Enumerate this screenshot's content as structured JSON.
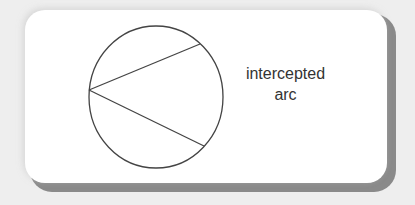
{
  "diagram": {
    "type": "inscribed-angle",
    "label_line1": "intercepted",
    "label_line2": "arc",
    "circle": {
      "cx": 156,
      "cy": 97,
      "rx": 67,
      "ry": 71
    },
    "vertex": {
      "x": 89,
      "y": 90
    },
    "chord_ends": [
      {
        "x": 200,
        "y": 44
      },
      {
        "x": 204,
        "y": 146
      }
    ],
    "stroke_color": "#444444",
    "card_color": "#ffffff",
    "shadow_color": "#8a8a8a"
  }
}
